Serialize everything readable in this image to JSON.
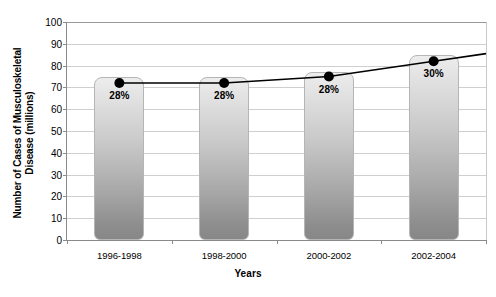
{
  "chart_data": {
    "type": "bar",
    "title": "",
    "subtitle": "",
    "xlabel": "Years",
    "ylabel": "Number of Cases of Musculoskeletal Disease (millions)",
    "ylabel_line1": "Number of Cases of Musculoskeletal",
    "ylabel_line2": "Disease (millions)",
    "categories": [
      "1996-1998",
      "1998-2000",
      "2000-2002",
      "2002-2004"
    ],
    "values": [
      75,
      75,
      77,
      85
    ],
    "ylim": [
      0,
      100
    ],
    "ytick_values": [
      0,
      10,
      20,
      30,
      40,
      50,
      60,
      70,
      80,
      90,
      100
    ],
    "ytick_labels": [
      "0",
      "10",
      "20",
      "30",
      "40",
      "50",
      "60",
      "70",
      "80",
      "90",
      "100"
    ],
    "grid": true,
    "legend": "none",
    "series": [
      {
        "name": "Number of Cases of Musculoskeletal Disease (millions)",
        "type": "bar",
        "values": [
          75,
          75,
          77,
          85
        ]
      },
      {
        "name": "Percent of population",
        "type": "line",
        "values": [
          72,
          72,
          75,
          82
        ],
        "point_labels": [
          "28%",
          "28%",
          "28%",
          "30%"
        ],
        "marker": "filled-circle",
        "color": "#000000"
      }
    ],
    "annotations": [
      {
        "category": "1996-1998",
        "text": "28%"
      },
      {
        "category": "1998-2000",
        "text": "28%"
      },
      {
        "category": "2000-2002",
        "text": "28%"
      },
      {
        "category": "2002-2004",
        "text": "30%"
      }
    ],
    "colors": {
      "bar_gradient_top": "#ededed",
      "bar_gradient_bottom": "#878787",
      "bar_border": "#b5b5b5",
      "line": "#000000",
      "marker": "#000000",
      "gridline": "#cfcfcf",
      "axis": "#8a8a8a",
      "background": "#ffffff",
      "text": "#000000"
    }
  }
}
